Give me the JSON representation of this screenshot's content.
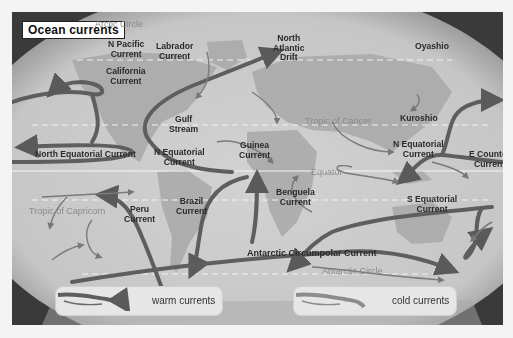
{
  "title": "Ocean currents",
  "latitude_lines": {
    "arctic_circle": "Arctic Circle",
    "tropic_of_cancer": "Tropic of Cancer",
    "equator": "Equator",
    "tropic_of_capricorn": "Tropic of Capricorn",
    "antarctic_circle": "Antarctic Circle"
  },
  "currents": {
    "n_pacific": [
      "N Pacific",
      "Current"
    ],
    "labrador": [
      "Labrador",
      "Current"
    ],
    "north_atlantic_drift": [
      "North",
      "Atlantic",
      "Drift"
    ],
    "oyashio": [
      "Oyashio"
    ],
    "california": [
      "California",
      "Current"
    ],
    "gulf_stream": [
      "Gulf",
      "Stream"
    ],
    "kuroshio": [
      "Kuroshio"
    ],
    "north_equatorial": [
      "North Equatorial Current"
    ],
    "n_equatorial_atlantic": [
      "N Equatorial",
      "Current"
    ],
    "guinea": [
      "Guinea",
      "Current"
    ],
    "n_equatorial_pacific": [
      "N Equatorial",
      "Current"
    ],
    "e_counter": [
      "E Counter",
      "Current"
    ],
    "peru": [
      "Peru",
      "Current"
    ],
    "brazil": [
      "Brazil",
      "Current"
    ],
    "benguela": [
      "Benguela",
      "Current"
    ],
    "s_equatorial": [
      "S Equatorial",
      "Current"
    ],
    "antarctic_circumpolar": [
      "Antarctic Circumpolar Current"
    ]
  },
  "legend": {
    "warm": "warm currents",
    "cold": "cold currents"
  },
  "colors": {
    "ocean": "#c8c8c8",
    "land": "#a9a9a9",
    "warm_arrow": "#5e5e5e",
    "cold_arrow": "#8c8c8c",
    "frame": "#3a3a3a"
  }
}
